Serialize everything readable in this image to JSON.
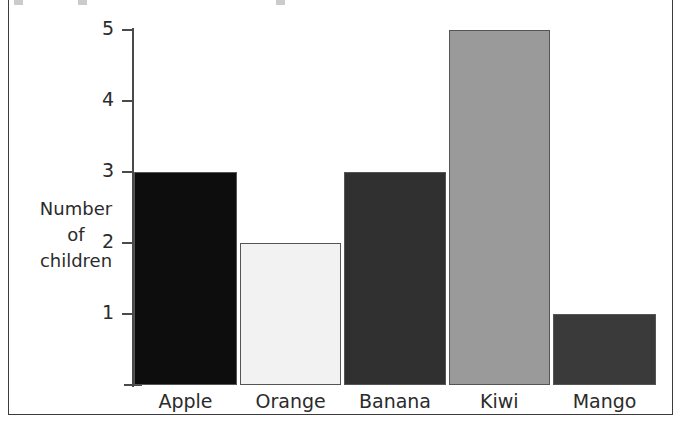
{
  "chart_data": {
    "type": "bar",
    "title": "",
    "xlabel": "",
    "ylabel": "Number of children",
    "ylabel_lines": [
      "Number",
      "of",
      "children"
    ],
    "categories": [
      "Apple",
      "Orange",
      "Banana",
      "Kiwi",
      "Mango"
    ],
    "values": [
      3,
      2,
      3,
      5,
      1
    ],
    "ylim": [
      0,
      5
    ],
    "yticks": [
      1,
      2,
      3,
      4,
      5
    ],
    "ytick_labels": [
      "1",
      "2",
      "3",
      "4",
      "5"
    ],
    "grid": false,
    "legend": false,
    "legend_position": "none",
    "bar_colors": [
      "#0d0d0d",
      "#f2f2f2",
      "#303030",
      "#9a9a9a",
      "#3a3a3a"
    ],
    "bars": [
      {
        "category": "Apple",
        "value": 3,
        "color": "#0d0d0d"
      },
      {
        "category": "Orange",
        "value": 2,
        "color": "#f2f2f2"
      },
      {
        "category": "Banana",
        "value": 3,
        "color": "#303030"
      },
      {
        "category": "Kiwi",
        "value": 5,
        "color": "#9a9a9a"
      },
      {
        "category": "Mango",
        "value": 1,
        "color": "#3a3a3a"
      }
    ]
  },
  "style": {
    "background": "#ffffff",
    "axis_color": "#4a4a4a",
    "text_color": "#2b2b2b",
    "frame_color": "#3c3c3c",
    "bar_outline_color": "#555555"
  }
}
